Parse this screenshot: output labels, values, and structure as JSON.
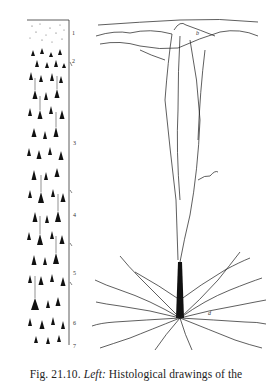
{
  "figure": {
    "left_panel": {
      "description": "Histological drawing of cortical layers (column of pyramidal cell bodies)",
      "layer_labels": [
        "1",
        "2",
        "3",
        "4",
        "5",
        "6",
        "7"
      ],
      "letter_labels": [
        "d",
        "c",
        "d'"
      ]
    },
    "right_panel": {
      "description": "Drawing of a single pyramidal neuron with apical dendrite and basal dendrites",
      "letter_labels": [
        "b",
        "d"
      ]
    }
  },
  "caption": {
    "prefix": "Fig. 21.10.",
    "emphasis": "Left:",
    "text": "Histological drawings of the"
  }
}
